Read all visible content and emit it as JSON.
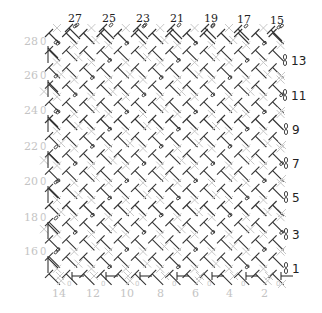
{
  "diagram": {
    "colors": {
      "stitch": "#333333",
      "single_crochet": "#c8c8c8",
      "label_dark": "#222222",
      "label_light": "#c4c4c4",
      "background": "#ffffff"
    },
    "grid": {
      "origin_x": 48,
      "origin_y": 30,
      "step": 17.2,
      "cols": 14,
      "rows": 15
    },
    "top_labels": [
      {
        "text": "27",
        "x": 68,
        "y": 13
      },
      {
        "text": "25",
        "x": 102,
        "y": 13
      },
      {
        "text": "23",
        "x": 136,
        "y": 13
      },
      {
        "text": "21",
        "x": 170,
        "y": 13
      },
      {
        "text": "19",
        "x": 204,
        "y": 13
      },
      {
        "text": "17",
        "x": 237,
        "y": 14
      },
      {
        "text": "15",
        "x": 270,
        "y": 15
      }
    ],
    "right_labels": [
      {
        "text": "13",
        "x": 291,
        "y": 56
      },
      {
        "text": "11",
        "x": 291,
        "y": 91
      },
      {
        "text": "9",
        "x": 292,
        "y": 125
      },
      {
        "text": "7",
        "x": 292,
        "y": 159
      },
      {
        "text": "5",
        "x": 292,
        "y": 193
      },
      {
        "text": "3",
        "x": 292,
        "y": 230
      },
      {
        "text": "1",
        "x": 292,
        "y": 264
      }
    ],
    "left_labels": [
      {
        "text": "28",
        "x": 24,
        "y": 36
      },
      {
        "text": "26",
        "x": 24,
        "y": 70
      },
      {
        "text": "24",
        "x": 24,
        "y": 105
      },
      {
        "text": "22",
        "x": 24,
        "y": 141
      },
      {
        "text": "20",
        "x": 24,
        "y": 176
      },
      {
        "text": "18",
        "x": 24,
        "y": 212
      },
      {
        "text": "16",
        "x": 24,
        "y": 246
      }
    ],
    "bottom_labels": [
      {
        "text": "14",
        "x": 52,
        "y": 288
      },
      {
        "text": "12",
        "x": 86,
        "y": 288
      },
      {
        "text": "10",
        "x": 120,
        "y": 288
      },
      {
        "text": "8",
        "x": 157,
        "y": 288
      },
      {
        "text": "6",
        "x": 192,
        "y": 288
      },
      {
        "text": "4",
        "x": 226,
        "y": 288
      },
      {
        "text": "2",
        "x": 261,
        "y": 288
      }
    ],
    "legend_symbols": [
      "double-crochet T",
      "chain oval 0",
      "single-crochet plus"
    ]
  }
}
